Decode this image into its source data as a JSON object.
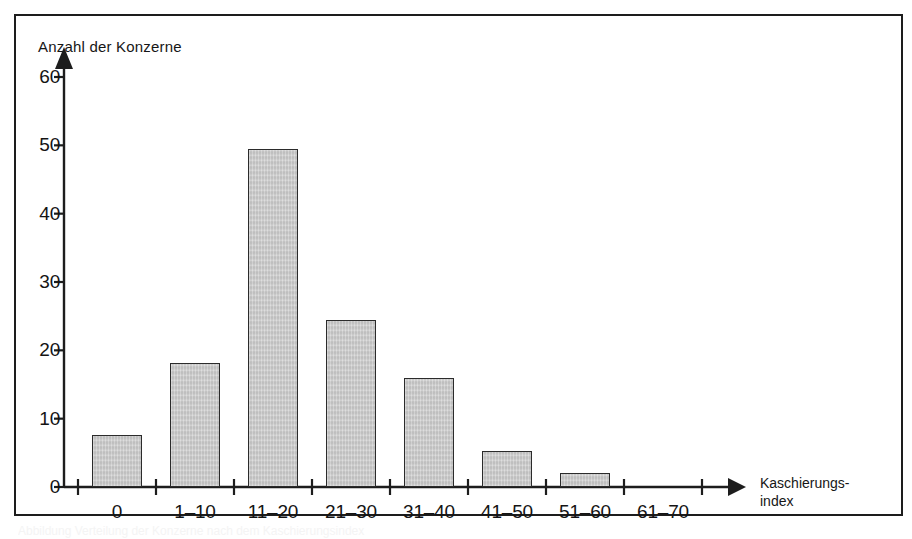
{
  "figure": {
    "frame_border_color": "#1d1d1d",
    "background_color": "#ffffff",
    "caption_text": "Abbildung  Verteilung der Konzerne nach dem Kaschierungsindex"
  },
  "chart_data": {
    "type": "bar",
    "title": "",
    "ylabel": "Anzahl der Konzerne",
    "xlabel": "Kaschierungs-index",
    "xlabel_line1": "Kaschierungs-",
    "xlabel_line2": "index",
    "categories": [
      "0",
      "1–10",
      "11–20",
      "21–30",
      "31–40",
      "41–50",
      "51–60",
      "61–70"
    ],
    "values": [
      7.6,
      18.2,
      49.4,
      24.4,
      16.0,
      5.3,
      2.1,
      0
    ],
    "ylim": [
      0,
      62
    ],
    "yticks": [
      0,
      10,
      20,
      30,
      40,
      50,
      60
    ],
    "ytick_labels": [
      "0",
      "10",
      "20",
      "30",
      "40",
      "50",
      "60"
    ],
    "grid": false,
    "legend": null,
    "bar_fill_color": "#c9c9c9",
    "bar_edge_color": "#2b2b2b",
    "axis_color": "#1d1d1d",
    "axis_arrows": true
  }
}
